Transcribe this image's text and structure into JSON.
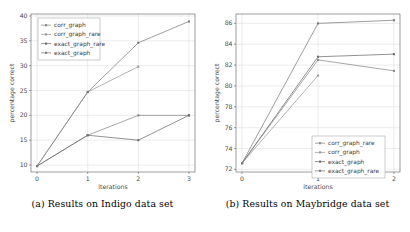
{
  "figure": {
    "subfigures": [
      {
        "caption": "(a) Results on Indigo data set",
        "chart_data": {
          "type": "line",
          "title": "",
          "xlabel": "iterations",
          "ylabel": "percentage correct",
          "x": [
            0,
            1,
            2,
            3
          ],
          "xticks": [
            "0",
            "1",
            "2",
            "3"
          ],
          "yticks": [
            "10",
            "15",
            "20",
            "25",
            "30",
            "35",
            "40"
          ],
          "xlim": [
            -0.12,
            3.12
          ],
          "ylim": [
            8.6,
            40.4
          ],
          "grid": true,
          "legend_position": "upper left",
          "series": [
            {
              "name": "corr_graph",
              "color": "#8a8a8a",
              "x": [
                0,
                1,
                2,
                3
              ],
              "values": [
                9.8,
                16.0,
                20.0,
                20.0
              ]
            },
            {
              "name": "corr_graph_rare",
              "color": "#9a9a9a",
              "x": [
                0,
                1,
                2
              ],
              "values": [
                9.8,
                24.7,
                29.8
              ]
            },
            {
              "name": "exact_graph_rare",
              "color": "#6e6e6e",
              "x": [
                0,
                1,
                2,
                3
              ],
              "values": [
                9.8,
                16.0,
                15.0,
                20.0
              ]
            },
            {
              "name": "exact_graph",
              "color": "#7d7d7d",
              "x": [
                0,
                1,
                2,
                3
              ],
              "values": [
                9.8,
                24.7,
                34.6,
                38.9
              ]
            }
          ]
        }
      },
      {
        "caption": "(b) Results on Maybridge data set",
        "chart_data": {
          "type": "line",
          "title": "",
          "xlabel": "iterations",
          "ylabel": "percentage correct",
          "x": [
            0,
            1,
            2
          ],
          "xticks": [
            "0",
            "1",
            "2"
          ],
          "yticks": [
            "72",
            "74",
            "76",
            "78",
            "80",
            "82",
            "84",
            "86"
          ],
          "xlim": [
            -0.08,
            2.08
          ],
          "ylim": [
            71.75,
            86.9
          ],
          "grid": true,
          "legend_position": "lower right",
          "series": [
            {
              "name": "corr_graph_rare",
              "color": "#8a8a8a",
              "x": [
                0,
                1,
                2
              ],
              "values": [
                72.6,
                82.5,
                81.45
              ]
            },
            {
              "name": "corr_graph",
              "color": "#9a9a9a",
              "x": [
                0,
                1
              ],
              "values": [
                72.6,
                81.0
              ]
            },
            {
              "name": "exact_graph",
              "color": "#6e6e6e",
              "x": [
                0,
                1,
                2
              ],
              "values": [
                72.6,
                82.8,
                83.05
              ]
            },
            {
              "name": "exact_graph_rare",
              "color": "#7d7d7d",
              "x": [
                0,
                1,
                2
              ],
              "values": [
                72.6,
                86.0,
                86.3
              ]
            }
          ]
        }
      }
    ]
  }
}
